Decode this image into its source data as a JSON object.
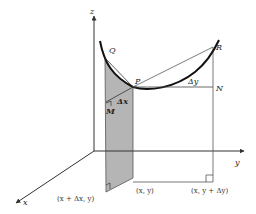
{
  "diagram": {
    "axes": {
      "x_label": "x",
      "y_label": "y",
      "z_label": "z"
    },
    "points": {
      "Q": "Q",
      "P": "P",
      "R": "R",
      "N": "N",
      "M": "M"
    },
    "increments": {
      "delta_x": "Δx",
      "delta_y": "Δy"
    },
    "coordinates": {
      "x_dx_y": "(x + Δx, y)",
      "x_y": "(x, y)",
      "x_y_dy": "(x, y + Δy)"
    },
    "colors": {
      "shaded_plane": "#b5b5b5",
      "curve": "#111111",
      "lines": "#444444",
      "background": "#ffffff"
    }
  }
}
